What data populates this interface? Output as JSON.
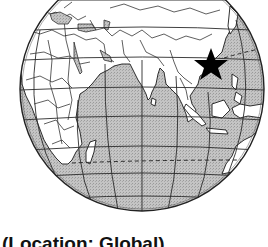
{
  "map": {
    "title": "Globe centered on the Indian Ocean",
    "projection": "orthographic",
    "marker": {
      "label": "China",
      "icon": "star-icon",
      "color": "#000000"
    },
    "colors": {
      "ocean": "#bdbdbd",
      "land": "#ffffff",
      "outline": "#1a1a1a",
      "graticule": "#2b2b2b"
    },
    "visible_regions": [
      "Europe",
      "Africa",
      "Middle East",
      "India",
      "China",
      "Southeast Asia",
      "Indonesia",
      "Australia",
      "Madagascar",
      "Indian Ocean"
    ]
  },
  "caption": {
    "text": "(Location: Global)"
  }
}
